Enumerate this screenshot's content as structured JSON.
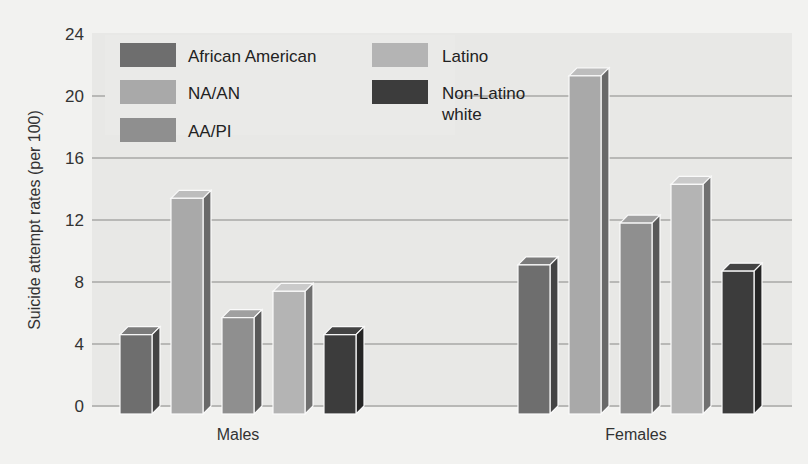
{
  "chart_data": {
    "type": "bar",
    "title": "",
    "xlabel": "",
    "ylabel": "Suicide attempt rates (per 100)",
    "ylim": [
      0,
      24
    ],
    "yticks": [
      0,
      4,
      8,
      12,
      16,
      20,
      24
    ],
    "grid": true,
    "legend_position": "top-left inside",
    "categories": [
      "Males",
      "Females"
    ],
    "series": [
      {
        "name": "African American",
        "color": "#6e6e6e",
        "values": [
          4.6,
          9.1
        ]
      },
      {
        "name": "NA/AN",
        "color": "#a9a9a9",
        "values": [
          13.4,
          21.3
        ]
      },
      {
        "name": "AA/PI",
        "color": "#8f8f8f",
        "values": [
          5.7,
          11.8
        ]
      },
      {
        "name": "Latino",
        "color": "#b4b4b4",
        "values": [
          7.4,
          14.3
        ]
      },
      {
        "name": "Non-Latino white",
        "color": "#3c3c3c",
        "values": [
          4.6,
          8.7
        ]
      }
    ]
  },
  "legend": {
    "items": [
      {
        "label": "African American"
      },
      {
        "label": "NA/AN"
      },
      {
        "label": "AA/PI"
      },
      {
        "label": "Latino"
      },
      {
        "label_line1": "Non-Latino",
        "label_line2": "white"
      }
    ]
  }
}
